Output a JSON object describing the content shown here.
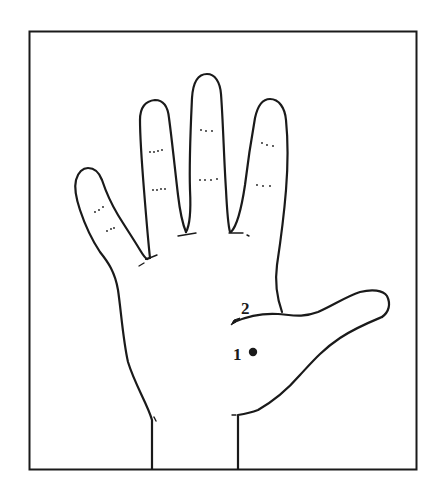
{
  "figure": {
    "frame": {
      "x": 29,
      "y": 31,
      "width": 387,
      "height": 438
    },
    "points": [
      {
        "label": "1",
        "x": 253,
        "y": 352,
        "type": "dot"
      },
      {
        "label": "2",
        "x": 244,
        "y": 311,
        "type": "crease-end"
      }
    ],
    "colors": {
      "ink": "#1a1a1a",
      "background": "#ffffff"
    }
  }
}
